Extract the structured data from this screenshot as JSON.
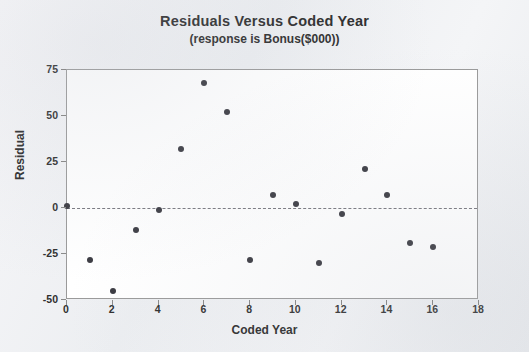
{
  "chart_data": {
    "type": "scatter",
    "title": "Residuals Versus Coded Year",
    "subtitle": "(response is Bonus($000))",
    "xlabel": "Coded Year",
    "ylabel": "Residual",
    "xlim": [
      0,
      18
    ],
    "ylim": [
      -50,
      75
    ],
    "grid": false,
    "legend": null,
    "reference_line": {
      "y": 0,
      "style": "dashed"
    },
    "x_ticks": [
      "0",
      "2",
      "4",
      "6",
      "8",
      "10",
      "12",
      "14",
      "16",
      "18"
    ],
    "x_tick_values": [
      0,
      2,
      4,
      6,
      8,
      10,
      12,
      14,
      16,
      18
    ],
    "y_ticks": [
      "75",
      "50",
      "25",
      "0",
      "-25",
      "-50"
    ],
    "y_tick_values": [
      75,
      50,
      25,
      0,
      -25,
      -50
    ],
    "marker_color": "#3a3a41",
    "x": [
      0,
      1,
      2,
      3,
      4,
      5,
      6,
      7,
      8,
      9,
      10,
      11,
      12,
      13,
      14,
      15,
      16
    ],
    "values": [
      1,
      -28,
      -45,
      -12,
      -1,
      32,
      68,
      52,
      -28,
      7,
      2,
      -30,
      -3,
      21,
      7,
      -19,
      -21
    ],
    "points": [
      {
        "x": 0,
        "y": 1
      },
      {
        "x": 1,
        "y": -28
      },
      {
        "x": 2,
        "y": -45
      },
      {
        "x": 3,
        "y": -12
      },
      {
        "x": 4,
        "y": -1
      },
      {
        "x": 5,
        "y": 32
      },
      {
        "x": 6,
        "y": 68
      },
      {
        "x": 7,
        "y": 52
      },
      {
        "x": 8,
        "y": -28
      },
      {
        "x": 9,
        "y": 7
      },
      {
        "x": 10,
        "y": 2
      },
      {
        "x": 11,
        "y": -30
      },
      {
        "x": 12,
        "y": -3
      },
      {
        "x": 13,
        "y": 21
      },
      {
        "x": 14,
        "y": 7
      },
      {
        "x": 15,
        "y": -19
      },
      {
        "x": 16,
        "y": -21
      }
    ]
  }
}
